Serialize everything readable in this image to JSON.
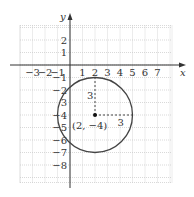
{
  "diagram": {
    "type": "coordinate-plane-circle",
    "axes": {
      "x_label": "x",
      "y_label": "y",
      "x_ticks": [
        "−3",
        "−2",
        "−1",
        "1",
        "2",
        "3",
        "4",
        "5",
        "6",
        "7"
      ],
      "x_tick_values": [
        -3,
        -2,
        -1,
        1,
        2,
        3,
        4,
        5,
        6,
        7
      ],
      "y_ticks": [
        "2",
        "1",
        "−1",
        "−2",
        "3",
        "−4",
        "−5",
        "−6",
        "−7",
        "−8"
      ],
      "y_tick_values": [
        2,
        1,
        -1,
        -2,
        -3,
        -4,
        -5,
        -6,
        -7,
        -8
      ],
      "grid_x_range": [
        -4,
        8
      ],
      "grid_y_range": [
        -9,
        3
      ]
    },
    "circle": {
      "center": [
        2,
        -4
      ],
      "radius": 3,
      "center_label": "(2, −4)",
      "vertical_radius_label": "3",
      "horizontal_radius_label": "3"
    },
    "colors": {
      "grid": "#c8c8c8",
      "axis": "#333333",
      "circle": "#444444",
      "text": "#333333"
    }
  }
}
